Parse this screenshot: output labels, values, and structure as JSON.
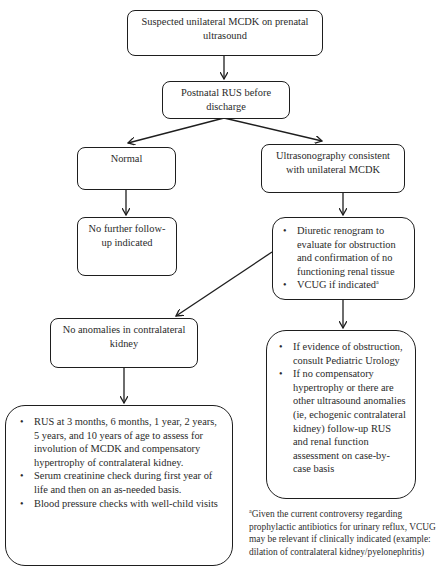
{
  "flowchart": {
    "title_box": {
      "text": "Suspected unilateral MCDK on prenatal ultrasound"
    },
    "step2": {
      "text": "Postnatal RUS before discharge"
    },
    "normal": {
      "text": "Normal"
    },
    "no_followup": {
      "text": "No further follow-up indicated"
    },
    "consistent": {
      "text": "Ultrasonography consistent with unilateral MCDK"
    },
    "diuretic": {
      "items": [
        "Diuretic renogram to evaluate for obstruction and confirmation of no functioning renal tissue",
        "VCUG if indicated"
      ],
      "footnote_marker": "a"
    },
    "no_anomalies": {
      "text": "No anomalies in contralateral kidney"
    },
    "monitoring": {
      "items": [
        "RUS at 3 months, 6 months, 1 year, 2 years, 5 years, and 10 years of age to assess for involution of MCDK and compensatory hypertrophy of contralateral kidney.",
        "Serum creatinine check during first year of life and then on an as-needed basis.",
        "Blood pressure checks with well-child visits"
      ]
    },
    "obstruction": {
      "items": [
        "If evidence of obstruction, consult Pediatric Urology",
        "If no compensatory hypertrophy or there are other ultrasound anomalies (ie, echogenic contralateral kidney) follow-up RUS and renal function assessment on case-by-case basis"
      ]
    },
    "footnote": {
      "marker": "a",
      "text": "Given the current controversy regarding prophylactic antibiotics for urinary reflux, VCUG may be relevant if clinically indicated (example: dilation of contralateral kidney/pyelonephritis)"
    }
  },
  "colors": {
    "line": "#1e1e1e",
    "text": "#2a2a2a",
    "background": "#ffffff"
  }
}
